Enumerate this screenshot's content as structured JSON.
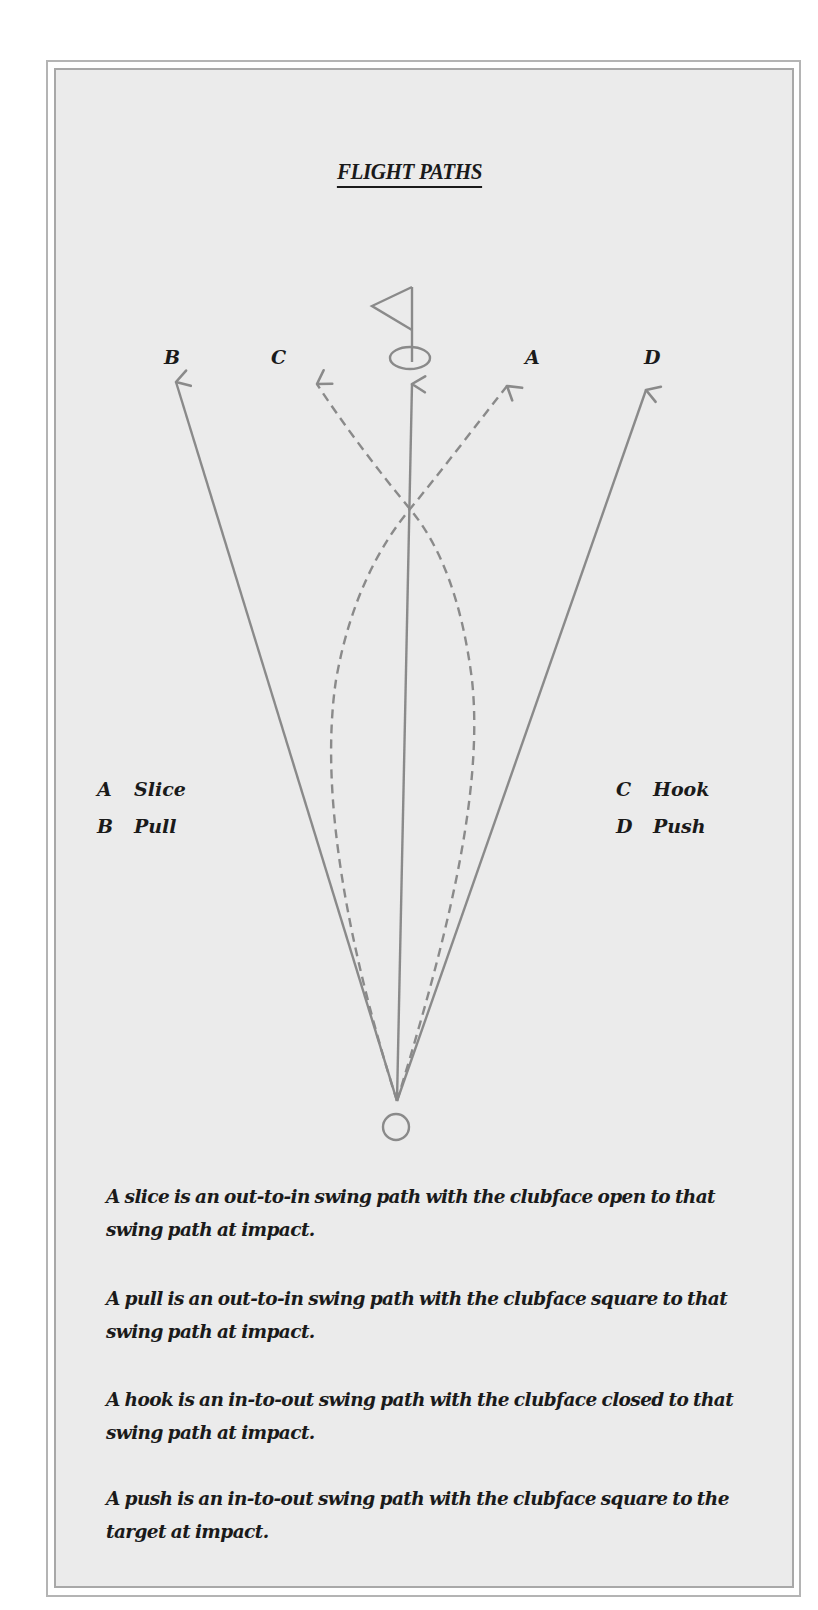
{
  "title": "FLIGHT PATHS",
  "colors": {
    "background": "#ebebeb",
    "frame": "#a8a8a8",
    "stroke": "#8a8a8a",
    "text": "#1a1a1a"
  },
  "icons": {
    "flag": "flag-icon",
    "hole": "hole-icon",
    "ball": "ball-icon"
  },
  "path_labels": {
    "b": "B",
    "c": "C",
    "a": "A",
    "d": "D"
  },
  "legend": {
    "left": [
      {
        "key": "A",
        "name": "Slice"
      },
      {
        "key": "B",
        "name": "Pull"
      }
    ],
    "right": [
      {
        "key": "C",
        "name": "Hook"
      },
      {
        "key": "D",
        "name": "Push"
      }
    ]
  },
  "paths": [
    {
      "key": "A",
      "name": "Slice",
      "style": "dashed",
      "curve": "bows left then crosses to right"
    },
    {
      "key": "B",
      "name": "Pull",
      "style": "solid",
      "curve": "straight left"
    },
    {
      "key": "C",
      "name": "Hook",
      "style": "dashed",
      "curve": "bows right then crosses to left"
    },
    {
      "key": "D",
      "name": "Push",
      "style": "solid",
      "curve": "straight right"
    },
    {
      "key": "",
      "name": "Straight to target",
      "style": "solid",
      "curve": "straight center"
    }
  ],
  "descriptions": [
    {
      "line1": "A slice is an out-to-in swing path with the clubface open to that",
      "line2": "swing path at impact."
    },
    {
      "line1": "A pull is an out-to-in swing path with the clubface square to that",
      "line2": "swing path at impact."
    },
    {
      "line1": "A hook is an in-to-out swing path with the clubface closed to that",
      "line2": "swing path at impact."
    },
    {
      "line1": "A push is an in-to-out swing path with the clubface square to the",
      "line2": "target at impact."
    }
  ]
}
